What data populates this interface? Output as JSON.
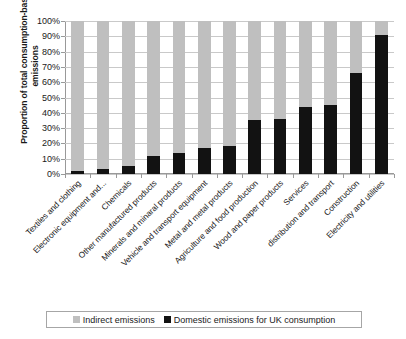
{
  "chart_data": {
    "type": "bar",
    "title": "",
    "subtitle": "",
    "xlabel": "",
    "ylabel": "Proportion of total consumption-based emissions",
    "ylim": [
      0,
      100
    ],
    "yunit": "%",
    "stacked": true,
    "grid": true,
    "legend_position": "bottom",
    "ytick_labels": [
      "100%",
      "90%",
      "80%",
      "70%",
      "60%",
      "50%",
      "40%",
      "30%",
      "20%",
      "10%",
      "0%"
    ],
    "ytick_values": [
      100,
      90,
      80,
      70,
      60,
      50,
      40,
      30,
      20,
      10,
      0
    ],
    "categories": [
      "Textiles and clothing",
      "Electronic equipment and...",
      "Chemicals",
      "Other manufactured products",
      "Minerals and minaral products",
      "Vehicle and transport equipment",
      "Metal and metal products",
      "Agriculture and food production",
      "Wood and paper products",
      "Services",
      "distribution and transport",
      "Construction",
      "Electricity and utilities"
    ],
    "series": [
      {
        "name": "Domestic emissions for UK consumption",
        "color": "#121212",
        "values": [
          2,
          3,
          5,
          12,
          14,
          17,
          18,
          35,
          36,
          44,
          45,
          66,
          91
        ]
      },
      {
        "name": "Indirect emissions",
        "color": "#bfbfbf",
        "values": [
          98,
          97,
          95,
          88,
          86,
          83,
          82,
          65,
          64,
          56,
          55,
          34,
          9
        ]
      }
    ]
  },
  "legend": {
    "entries": [
      {
        "label": "Indirect emissions",
        "swatch": "indirect"
      },
      {
        "label": "Domestic emissions for UK consumption",
        "swatch": "domestic"
      }
    ]
  }
}
